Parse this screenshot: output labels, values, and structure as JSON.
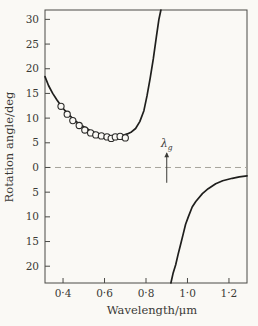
{
  "figure": {
    "background": "#faf9f5",
    "curve_color": "#1f1f1d",
    "frame_color": "#4a4a46",
    "text_color": "#3a3a36",
    "dashed_line_color": "#a6a49c",
    "point_stroke_color": "#2b2b29"
  },
  "chart_data": {
    "type": "line",
    "title": "",
    "xlabel": "Wavelength/μm",
    "ylabel": "Rotation angle/deg",
    "xlim": [
      0.313,
      1.287
    ],
    "ylim": [
      -23.4,
      31.9
    ],
    "grid": false,
    "legend": "none",
    "x_ticks": [
      {
        "v": 0.4,
        "label": "0·4"
      },
      {
        "v": 0.6,
        "label": "0·6"
      },
      {
        "v": 0.8,
        "label": "0·8"
      },
      {
        "v": 1.0,
        "label": "1·0"
      },
      {
        "v": 1.2,
        "label": "1·2"
      }
    ],
    "y_ticks": [
      {
        "v": 30,
        "label": "30"
      },
      {
        "v": 25,
        "label": "25"
      },
      {
        "v": 20,
        "label": "20"
      },
      {
        "v": 15,
        "label": "15"
      },
      {
        "v": 10,
        "label": "10"
      },
      {
        "v": 5,
        "label": "5"
      },
      {
        "v": 0,
        "label": "0"
      },
      {
        "v": -5,
        "label": "5"
      },
      {
        "v": -10,
        "label": "10"
      },
      {
        "v": -15,
        "label": "15"
      },
      {
        "v": -20,
        "label": "20"
      }
    ],
    "zero_line": {
      "y": 0,
      "style": "dashed"
    },
    "annotation": {
      "label_main": "λ",
      "label_sub": "g",
      "x": 0.9,
      "line_top": 2.9,
      "line_bottom": -3.1
    },
    "series": [
      {
        "name": "curve-below-resonance",
        "type": "line",
        "points": [
          [
            0.313,
            18.4
          ],
          [
            0.33,
            16.6
          ],
          [
            0.35,
            15.0
          ],
          [
            0.37,
            13.7
          ],
          [
            0.39,
            12.5
          ],
          [
            0.41,
            11.5
          ],
          [
            0.43,
            10.6
          ],
          [
            0.45,
            9.8
          ],
          [
            0.47,
            9.1
          ],
          [
            0.49,
            8.5
          ],
          [
            0.51,
            8.0
          ],
          [
            0.53,
            7.5
          ],
          [
            0.55,
            7.1
          ],
          [
            0.57,
            6.8
          ],
          [
            0.59,
            6.6
          ],
          [
            0.61,
            6.4
          ],
          [
            0.63,
            6.3
          ],
          [
            0.65,
            6.3
          ],
          [
            0.67,
            6.4
          ],
          [
            0.69,
            6.5
          ],
          [
            0.71,
            6.8
          ],
          [
            0.73,
            7.2
          ],
          [
            0.75,
            7.9
          ],
          [
            0.77,
            9.3
          ],
          [
            0.79,
            11.5
          ],
          [
            0.805,
            14.5
          ],
          [
            0.82,
            18.0
          ],
          [
            0.835,
            22.0
          ],
          [
            0.85,
            26.5
          ],
          [
            0.862,
            30.0
          ],
          [
            0.872,
            31.9
          ]
        ]
      },
      {
        "name": "curve-above-resonance",
        "type": "line",
        "points": [
          [
            0.92,
            -23.4
          ],
          [
            0.93,
            -21.5
          ],
          [
            0.943,
            -19.7
          ],
          [
            0.955,
            -17.6
          ],
          [
            0.967,
            -15.6
          ],
          [
            0.98,
            -13.4
          ],
          [
            0.991,
            -11.5
          ],
          [
            1.005,
            -9.9
          ],
          [
            1.023,
            -8.0
          ],
          [
            1.04,
            -6.9
          ],
          [
            1.072,
            -5.3
          ],
          [
            1.1,
            -4.3
          ],
          [
            1.136,
            -3.3
          ],
          [
            1.17,
            -2.7
          ],
          [
            1.216,
            -2.2
          ],
          [
            1.25,
            -1.9
          ],
          [
            1.287,
            -1.7
          ]
        ]
      },
      {
        "name": "measured-points",
        "type": "scatter",
        "points": [
          [
            0.39,
            12.4
          ],
          [
            0.42,
            10.8
          ],
          [
            0.447,
            9.5
          ],
          [
            0.478,
            8.5
          ],
          [
            0.505,
            7.6
          ],
          [
            0.533,
            7.0
          ],
          [
            0.558,
            6.6
          ],
          [
            0.585,
            6.4
          ],
          [
            0.612,
            6.2
          ],
          [
            0.632,
            5.9
          ],
          [
            0.652,
            6.2
          ],
          [
            0.675,
            6.3
          ],
          [
            0.7,
            6.0
          ]
        ]
      }
    ]
  }
}
